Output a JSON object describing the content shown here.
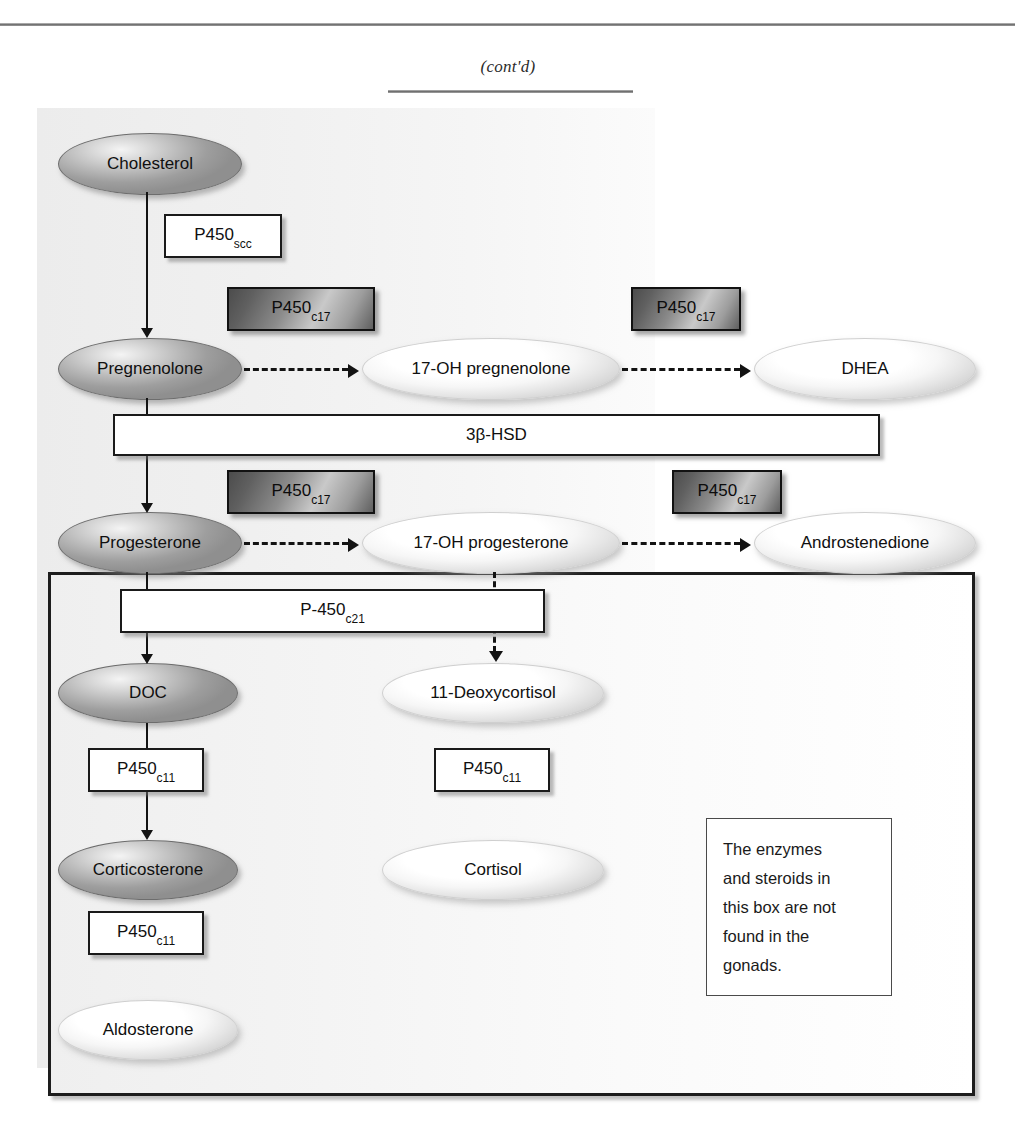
{
  "page": {
    "continued_label": "(cont'd)"
  },
  "diagram": {
    "note_box": {
      "lines": [
        "The enzymes",
        "and steroids in",
        "this box are not",
        "found in the",
        "gonads."
      ]
    },
    "steroids": [
      {
        "id": "cholesterol",
        "label": "Cholesterol",
        "shade": "dark"
      },
      {
        "id": "pregnenolone",
        "label": "Pregnenolone",
        "shade": "dark"
      },
      {
        "id": "17oh-pregnenolone",
        "label": "17-OH pregnenolone",
        "shade": "light"
      },
      {
        "id": "dhea",
        "label": "DHEA",
        "shade": "light"
      },
      {
        "id": "progesterone",
        "label": "Progesterone",
        "shade": "dark"
      },
      {
        "id": "17oh-progesterone",
        "label": "17-OH progesterone",
        "shade": "light"
      },
      {
        "id": "androstenedione",
        "label": "Androstenedione",
        "shade": "light"
      },
      {
        "id": "doc",
        "label": "DOC",
        "shade": "dark"
      },
      {
        "id": "11-deoxycortisol",
        "label": "11-Deoxycortisol",
        "shade": "light"
      },
      {
        "id": "corticosterone",
        "label": "Corticosterone",
        "shade": "dark"
      },
      {
        "id": "cortisol",
        "label": "Cortisol",
        "shade": "light"
      },
      {
        "id": "aldosterone",
        "label": "Aldosterone",
        "shade": "light"
      }
    ],
    "enzymes": [
      {
        "id": "p450scc",
        "base": "P450",
        "sub": "scc",
        "style": "white"
      },
      {
        "id": "p450c17-preg",
        "base": "P450",
        "sub": "c17",
        "style": "shaded"
      },
      {
        "id": "p450c17-17ohpreg",
        "base": "P450",
        "sub": "c17",
        "style": "shaded"
      },
      {
        "id": "3b-hsd",
        "base": "3β-HSD",
        "sub": "",
        "style": "white"
      },
      {
        "id": "p450c17-prog",
        "base": "P450",
        "sub": "c17",
        "style": "shaded"
      },
      {
        "id": "p450c17-17ohprog",
        "base": "P450",
        "sub": "c17",
        "style": "shaded"
      },
      {
        "id": "p450c21",
        "base": "P-450",
        "sub": "c21",
        "style": "white"
      },
      {
        "id": "p450c11-doc",
        "base": "P450",
        "sub": "c11",
        "style": "white"
      },
      {
        "id": "p450c11-deoxy",
        "base": "P450",
        "sub": "c11",
        "style": "white"
      },
      {
        "id": "p450c11-cortico",
        "base": "P450",
        "sub": "c11",
        "style": "white"
      }
    ],
    "colors": {
      "line": "#131313",
      "box_border": "#1a1a1a",
      "page_background": "#ffffff",
      "shaded_band": "#f1f1f1"
    }
  }
}
